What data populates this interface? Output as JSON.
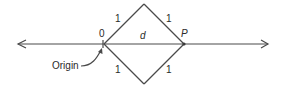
{
  "diagram": {
    "labels": {
      "origin_point": "0",
      "point_p": "P",
      "distance": "d",
      "edge_top_left": "1",
      "edge_top_right": "1",
      "edge_bottom_left": "1",
      "edge_bottom_right": "1",
      "origin_caption": "Origin"
    },
    "colors": {
      "line": "#4a4a4a",
      "text": "#2a2a2a",
      "background": "#ffffff"
    }
  }
}
